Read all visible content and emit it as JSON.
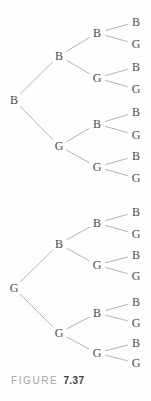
{
  "figure": {
    "caption_prefix": "FIGURE",
    "caption_number": "7.37"
  },
  "style": {
    "background_color": "#fefefe",
    "edge_color": "#b3b3b3",
    "node_color": "#4b4b4b",
    "caption_prefix_color": "#a5a5a5",
    "caption_number_color": "#3d3d3d"
  },
  "trees": [
    {
      "id": "tree-top",
      "nodes": [
        {
          "id": "root",
          "label": "B",
          "x": 14,
          "y": 100,
          "parent": null
        },
        {
          "id": "b",
          "label": "B",
          "x": 59,
          "y": 56,
          "parent": "root"
        },
        {
          "id": "g",
          "label": "G",
          "x": 59,
          "y": 146,
          "parent": "root"
        },
        {
          "id": "bb",
          "label": "B",
          "x": 97,
          "y": 33,
          "parent": "b"
        },
        {
          "id": "bg",
          "label": "G",
          "x": 97,
          "y": 78,
          "parent": "b"
        },
        {
          "id": "gb",
          "label": "B",
          "x": 97,
          "y": 124,
          "parent": "g"
        },
        {
          "id": "gg",
          "label": "G",
          "x": 97,
          "y": 167,
          "parent": "g"
        },
        {
          "id": "bbb",
          "label": "B",
          "x": 136,
          "y": 22,
          "parent": "bb"
        },
        {
          "id": "bbg",
          "label": "G",
          "x": 136,
          "y": 44,
          "parent": "bb"
        },
        {
          "id": "bgb",
          "label": "B",
          "x": 136,
          "y": 67,
          "parent": "bg"
        },
        {
          "id": "bgg",
          "label": "G",
          "x": 136,
          "y": 89,
          "parent": "bg"
        },
        {
          "id": "gbb",
          "label": "B",
          "x": 136,
          "y": 112,
          "parent": "gb"
        },
        {
          "id": "gbg",
          "label": "G",
          "x": 136,
          "y": 135,
          "parent": "gb"
        },
        {
          "id": "ggb",
          "label": "B",
          "x": 136,
          "y": 156,
          "parent": "gg"
        },
        {
          "id": "ggg",
          "label": "G",
          "x": 136,
          "y": 178,
          "parent": "gg"
        }
      ]
    },
    {
      "id": "tree-bottom",
      "nodes": [
        {
          "id": "root",
          "label": "G",
          "x": 14,
          "y": 288,
          "parent": null
        },
        {
          "id": "b",
          "label": "B",
          "x": 59,
          "y": 244,
          "parent": "root"
        },
        {
          "id": "g",
          "label": "G",
          "x": 59,
          "y": 333,
          "parent": "root"
        },
        {
          "id": "bb",
          "label": "B",
          "x": 97,
          "y": 223,
          "parent": "b"
        },
        {
          "id": "bg",
          "label": "G",
          "x": 97,
          "y": 265,
          "parent": "b"
        },
        {
          "id": "gb",
          "label": "B",
          "x": 97,
          "y": 313,
          "parent": "g"
        },
        {
          "id": "gg",
          "label": "G",
          "x": 97,
          "y": 353,
          "parent": "g"
        },
        {
          "id": "bbb",
          "label": "B",
          "x": 136,
          "y": 212,
          "parent": "bb"
        },
        {
          "id": "bbg",
          "label": "G",
          "x": 136,
          "y": 234,
          "parent": "bb"
        },
        {
          "id": "bgb",
          "label": "B",
          "x": 136,
          "y": 255,
          "parent": "bg"
        },
        {
          "id": "bgg",
          "label": "G",
          "x": 136,
          "y": 276,
          "parent": "bg"
        },
        {
          "id": "gbb",
          "label": "B",
          "x": 136,
          "y": 302,
          "parent": "gb"
        },
        {
          "id": "gbg",
          "label": "G",
          "x": 136,
          "y": 323,
          "parent": "gb"
        },
        {
          "id": "ggb",
          "label": "B",
          "x": 136,
          "y": 343,
          "parent": "gg"
        },
        {
          "id": "ggg",
          "label": "G",
          "x": 136,
          "y": 363,
          "parent": "gg"
        }
      ]
    }
  ]
}
